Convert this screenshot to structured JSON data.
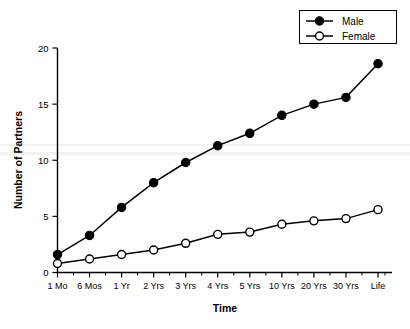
{
  "chart_data": {
    "type": "line",
    "title": "",
    "xlabel": "Time",
    "ylabel": "Number of Partners",
    "categories": [
      "1 Mo",
      "6 Mos",
      "1 Yr",
      "2 Yrs",
      "3 Yrs",
      "4 Yrs",
      "5 Yrs",
      "10 Yrs",
      "20 Yrs",
      "30 Yrs",
      "Life"
    ],
    "series": [
      {
        "name": "Male",
        "marker": "filled-circle",
        "color": "#000000",
        "values": [
          1.6,
          3.3,
          5.8,
          8.0,
          9.8,
          11.3,
          12.4,
          14.0,
          15.0,
          15.6,
          18.6
        ]
      },
      {
        "name": "Female",
        "marker": "open-circle",
        "color": "#000000",
        "values": [
          0.8,
          1.2,
          1.6,
          2.0,
          2.6,
          3.4,
          3.6,
          4.3,
          4.6,
          4.8,
          5.6
        ]
      }
    ],
    "ylim": [
      0,
      20
    ],
    "yticks": [
      0,
      5,
      10,
      15,
      20
    ],
    "ytick_labels": [
      "0",
      "5",
      "10",
      "15",
      "20"
    ],
    "grid": false,
    "legend_position": "top-right"
  },
  "legend": {
    "entries": [
      {
        "label": "Male",
        "marker": "filled-circle"
      },
      {
        "label": "Female",
        "marker": "open-circle"
      }
    ]
  },
  "axes": {
    "y_title": "Number of Partners",
    "x_title": "Time",
    "y_labels": [
      "20",
      "15",
      "10",
      "5",
      "0"
    ],
    "x_labels": [
      "1 Mo",
      "6 Mos",
      "1 Yr",
      "2 Yrs",
      "3 Yrs",
      "4 Yrs",
      "5 Yrs",
      "10 Yrs",
      "20 Yrs",
      "30 Yrs",
      "Life"
    ]
  }
}
